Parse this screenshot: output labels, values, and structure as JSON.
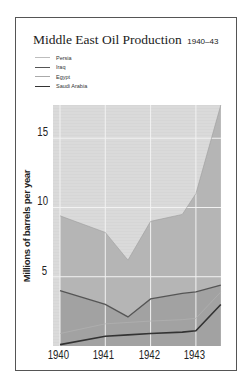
{
  "chart_data": {
    "type": "area",
    "title": "Middle East Oil Production",
    "subtitle": "1940–43",
    "xlabel": "",
    "ylabel": "Millions of barrels per year",
    "x_ticks": [
      "1940",
      "1941",
      "1942",
      "1943"
    ],
    "y_ticks": [
      "5",
      "10",
      "15"
    ],
    "ylim": [
      0,
      17.4
    ],
    "xlim": [
      1940,
      1943.55
    ],
    "grid": true,
    "legend_position": "top-left",
    "stacked": true,
    "x": [
      1940,
      1941,
      1941.5,
      1942,
      1942.7,
      1943,
      1943.55
    ],
    "series": [
      {
        "name": "Saudi Arabia",
        "values": [
          0.1,
          0.7,
          0.8,
          0.9,
          1.0,
          1.1,
          3.0
        ]
      },
      {
        "name": "Egypt",
        "values": [
          0.8,
          0.9,
          0.9,
          0.9,
          0.9,
          0.9,
          0.9
        ]
      },
      {
        "name": "Iraq",
        "values": [
          3.1,
          1.4,
          0.4,
          1.6,
          1.9,
          1.9,
          0.5
        ]
      },
      {
        "name": "Persia",
        "values": [
          5.4,
          5.2,
          4.1,
          5.6,
          5.7,
          7.0,
          13.0
        ]
      }
    ],
    "cumulative_totals": {
      "iraq_top": [
        4.0,
        3.0,
        2.1,
        3.4,
        3.8,
        3.9,
        4.4
      ],
      "persia_top": [
        9.4,
        8.2,
        6.2,
        9.0,
        9.5,
        11.0,
        17.4
      ]
    }
  },
  "legend": [
    {
      "label": "Persia",
      "color": "#bdbdbd",
      "width": 1
    },
    {
      "label": "Iraq",
      "color": "#555555",
      "width": 1.4
    },
    {
      "label": "Egypt",
      "color": "#aaaaaa",
      "width": 1
    },
    {
      "label": "Saudi Arabia",
      "color": "#333333",
      "width": 1.6
    }
  ],
  "colors": {
    "background_area": "#d6d6d6",
    "persia_fill": "#c9c9c9",
    "iraq_fill": "#a9a9a9",
    "grid": "#f2f2f2",
    "frame": "#555555"
  }
}
